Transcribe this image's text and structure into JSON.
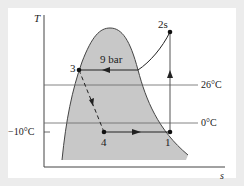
{
  "diagram": {
    "type": "T-s diagram (vapor-compression refrigeration cycle)",
    "axes": {
      "y_label": "T",
      "x_label": "s"
    },
    "states": [
      {
        "id": "1",
        "label": "1"
      },
      {
        "id": "2s",
        "label": "2s"
      },
      {
        "id": "3",
        "label": "3"
      },
      {
        "id": "4",
        "label": "4"
      }
    ],
    "labels": {
      "pressure": "9 bar",
      "t_high": "26°C",
      "t_zero": "0°C",
      "t_low": "−10°C"
    },
    "colors": {
      "dome_fill": "#c8c8c8",
      "line": "#333333",
      "background": "#ececec",
      "panel": "#ffffff"
    }
  }
}
